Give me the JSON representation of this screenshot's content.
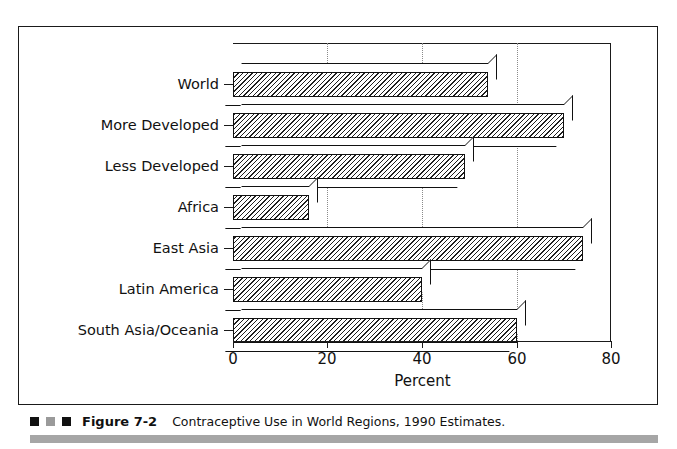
{
  "figure": {
    "number": "Figure 7-2",
    "caption": "Contraceptive Use in World Regions, 1990 Estimates.",
    "marker_colors": [
      "#111111",
      "#9a9a9a",
      "#111111"
    ],
    "rule_color": "#a6a6a6"
  },
  "chart_data": {
    "type": "bar",
    "orientation": "horizontal",
    "title": "",
    "subtitle": "",
    "xlabel": "Percent",
    "ylabel": "",
    "categories": [
      "World",
      "More Developed",
      "Less Developed",
      "Africa",
      "East Asia",
      "Latin America",
      "South Asia/Oceania"
    ],
    "values": [
      54,
      70,
      49,
      16,
      74,
      40,
      60
    ],
    "xlim": [
      0,
      80
    ],
    "xticks": [
      0,
      20,
      40,
      60,
      80
    ],
    "xticklabels": [
      "0",
      "20",
      "40",
      "60",
      "80"
    ],
    "grid": "vertical-dotted",
    "legend": "none",
    "bar_style": "3d-hatched",
    "bar_fill": "#ffffff",
    "bar_hatch_color": "#1f1f1f",
    "axis_color": "#1a1a1a"
  }
}
